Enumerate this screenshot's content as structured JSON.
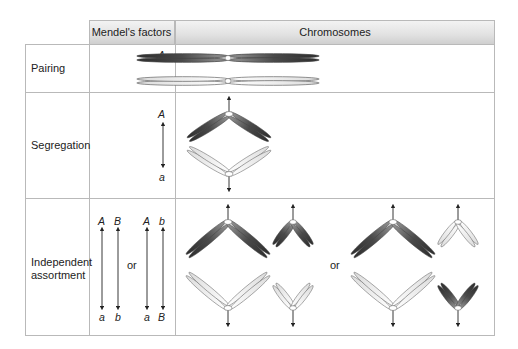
{
  "table": {
    "columns": [
      "",
      "Mendel's factors",
      "Chromosomes"
    ],
    "rows": [
      {
        "label": "Pairing",
        "factors": [
          "A",
          "a"
        ],
        "chromosomes": "homologous chromosome pair aligned horizontally (dark above, light below)"
      },
      {
        "label": "Segregation",
        "factors": [
          "A",
          "a"
        ],
        "chromosomes": "dark chromosome pulled upward, light chromosome pulled downward"
      },
      {
        "label_lines": [
          "Independent",
          "assortment"
        ],
        "factors": {
          "option1": {
            "top": [
              "A",
              "B"
            ],
            "bottom": [
              "a",
              "b"
            ]
          },
          "separator": "or",
          "option2": {
            "top": [
              "A",
              "b"
            ],
            "bottom": [
              "a",
              "B"
            ]
          }
        },
        "chromosomes": {
          "option1": "dark large + dark small move up; light large + light small move down",
          "separator": "or",
          "option2": "dark large + light small move up; light large + dark small move down"
        }
      }
    ]
  },
  "colors": {
    "dark_chromosome": "#3a3a3a",
    "light_chromosome": "#e8e8e8",
    "outline": "#555555",
    "grid": "#b9b9b9",
    "header_bg": "#dcdcdc"
  }
}
